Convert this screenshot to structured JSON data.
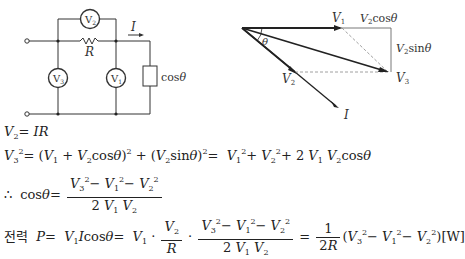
{
  "circuit": {
    "meters": {
      "v1": "V1",
      "v2": "V2",
      "v3": "V3"
    },
    "resistor_label": "R",
    "current_label": "I",
    "load_label": "cosθ"
  },
  "phasor": {
    "labels": {
      "v1": "V1",
      "v2": "V2",
      "v3": "V3",
      "i": "I",
      "theta": "θ",
      "v2cos": "V2cosθ",
      "v2sin": "V2sinθ"
    }
  },
  "equations": {
    "eq1": {
      "lhs": "V",
      "lhs_sub": "2",
      "rhs": "= IR"
    },
    "eq2": "V3² = (V1 + V2cosθ)² + (V2sinθ)² = V1² + V2² + 2 V1 V2cosθ",
    "eq3": {
      "prefix": "∴ cosθ =",
      "numerator": "V3² − V1² − V2²",
      "denominator": "2 V1 V2"
    },
    "eq4": {
      "korean_label": "전력",
      "text": "P = V1 I cosθ = V1 · (V2/R) · (V3² − V1² − V2²)/(2 V1 V2) = 1/(2R) (V3² − V1² − V2²) [W]",
      "unit": "[W]"
    }
  }
}
